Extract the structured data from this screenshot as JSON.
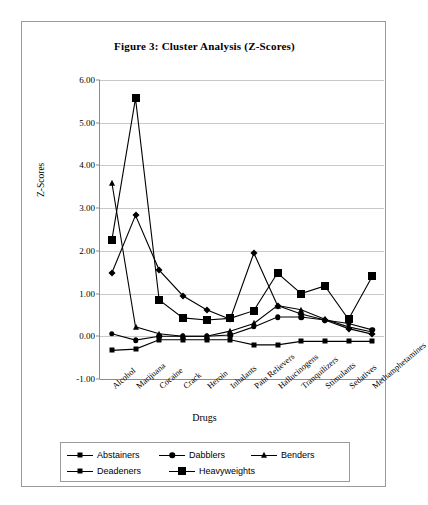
{
  "figure": {
    "title": "Figure 3: Cluster Analysis (Z-Scores)",
    "xlabel": "Drugs",
    "ylabel": "Z-Scores"
  },
  "chart_data": {
    "type": "line",
    "title": "Figure 3: Cluster Analysis (Z-Scores)",
    "xlabel": "Drugs",
    "ylabel": "Z-Scores",
    "ylim": [
      -1.0,
      6.0
    ],
    "ytick_step": 1.0,
    "yticks": [
      "6.00",
      "5.00",
      "4.00",
      "3.00",
      "2.00",
      "1.00",
      "0.00",
      "-1.00"
    ],
    "grid": true,
    "legend_position": "bottom",
    "categories": [
      "Alcohol",
      "Marijuana",
      "Cocaine",
      "Crack",
      "Heroin",
      "Inhalants",
      "Pain Relievers",
      "Hallucinogens",
      "Tranquilizers",
      "Stimulants",
      "Sedatives",
      "Methamphetamines"
    ],
    "series": [
      {
        "name": "Abstainers",
        "marker": "square-small",
        "values": [
          -0.33,
          -0.3,
          -0.08,
          -0.08,
          -0.08,
          -0.08,
          -0.2,
          -0.2,
          -0.12,
          -0.12,
          -0.12,
          -0.12
        ]
      },
      {
        "name": "Dabblers",
        "marker": "circle",
        "values": [
          0.06,
          -0.09,
          0.0,
          0.0,
          0.0,
          0.03,
          0.22,
          0.45,
          0.45,
          0.38,
          0.3,
          0.15
        ]
      },
      {
        "name": "Benders",
        "marker": "triangle",
        "values": [
          3.6,
          0.22,
          0.06,
          0.0,
          0.0,
          0.12,
          0.3,
          0.72,
          0.62,
          0.4,
          0.22,
          0.1
        ]
      },
      {
        "name": "Deadeners",
        "marker": "diamond",
        "values": [
          1.48,
          2.83,
          1.55,
          0.95,
          0.62,
          0.4,
          1.95,
          0.72,
          0.52,
          0.38,
          0.18,
          0.05
        ]
      },
      {
        "name": "Heavyweights",
        "marker": "square-large",
        "values": [
          2.25,
          5.57,
          0.85,
          0.43,
          0.38,
          0.42,
          0.6,
          1.48,
          1.0,
          1.18,
          0.4,
          1.4
        ]
      }
    ]
  },
  "legend": {
    "items": [
      {
        "label": "Abstainers",
        "marker": "square-small"
      },
      {
        "label": "Dabblers",
        "marker": "circle"
      },
      {
        "label": "Benders",
        "marker": "triangle"
      },
      {
        "label": "Deadeners",
        "marker": "diamond"
      },
      {
        "label": "Heavyweights",
        "marker": "square-large"
      }
    ]
  }
}
